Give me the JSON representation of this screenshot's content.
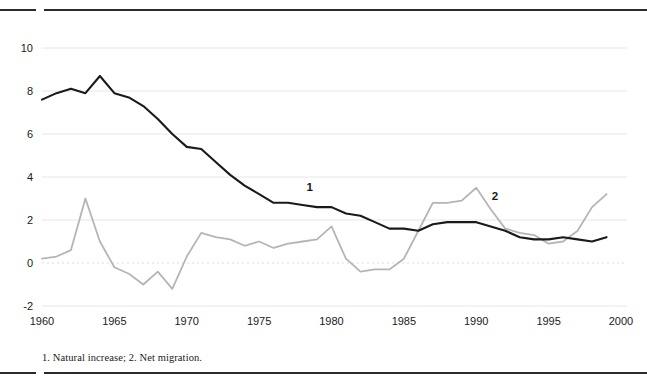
{
  "footnote": "1. Natural increase; 2. Net migration.",
  "colors": {
    "series1": "#1a1a1a",
    "series2": "#b5b5b5",
    "grid": "#e6e6e6",
    "zero_line": "#dcdcdc",
    "rule": "#2b2b2b",
    "text": "#1a1a1a",
    "background": "#ffffff"
  },
  "chart_data": {
    "type": "line",
    "title": "",
    "subtitle": "",
    "xlabel": "",
    "ylabel": "",
    "xlim": [
      1960,
      2000
    ],
    "ylim": [
      -2,
      10
    ],
    "grid": true,
    "gridlines_y": [
      -2,
      0,
      2,
      4,
      6,
      8,
      10
    ],
    "xticks": [
      "1960",
      "1965",
      "1970",
      "1975",
      "1980",
      "1985",
      "1990",
      "1995",
      "2000"
    ],
    "xtick_values": [
      1960,
      1965,
      1970,
      1975,
      1980,
      1985,
      1990,
      1995,
      2000
    ],
    "yticks": [
      "-2",
      "0",
      "2",
      "4",
      "6",
      "8",
      "10"
    ],
    "ytick_values": [
      -2,
      0,
      2,
      4,
      6,
      8,
      10
    ],
    "legend_position": "inline-annotation",
    "annotations": [
      {
        "text": "1",
        "x": 1978.5,
        "y": 3.35,
        "series": "series1"
      },
      {
        "text": "2",
        "x": 1991.3,
        "y": 2.95,
        "series": "series2"
      }
    ],
    "x": [
      1960,
      1961,
      1962,
      1963,
      1964,
      1965,
      1966,
      1967,
      1968,
      1969,
      1970,
      1971,
      1972,
      1973,
      1974,
      1975,
      1976,
      1977,
      1978,
      1979,
      1980,
      1981,
      1982,
      1983,
      1984,
      1985,
      1986,
      1987,
      1988,
      1989,
      1990,
      1991,
      1992,
      1993,
      1994,
      1995,
      1996,
      1997,
      1998,
      1999
    ],
    "series": [
      {
        "name": "1",
        "label": "Natural increase",
        "color": "#1a1a1a",
        "values": [
          7.6,
          7.9,
          8.1,
          7.9,
          8.7,
          7.9,
          7.7,
          7.3,
          6.7,
          6.0,
          5.4,
          5.3,
          4.7,
          4.1,
          3.6,
          3.2,
          2.8,
          2.8,
          2.7,
          2.6,
          2.6,
          2.3,
          2.2,
          1.9,
          1.6,
          1.6,
          1.5,
          1.8,
          1.9,
          1.9,
          1.9,
          1.7,
          1.5,
          1.2,
          1.1,
          1.1,
          1.2,
          1.1,
          1.0,
          1.2
        ]
      },
      {
        "name": "2",
        "label": "Net migration",
        "color": "#b5b5b5",
        "values": [
          0.2,
          0.3,
          0.6,
          3.0,
          1.0,
          -0.2,
          -0.5,
          -1.0,
          -0.4,
          -1.2,
          0.3,
          1.4,
          1.2,
          1.1,
          0.8,
          1.0,
          0.7,
          0.9,
          1.0,
          1.1,
          1.7,
          0.2,
          -0.4,
          -0.3,
          -0.3,
          0.2,
          1.5,
          2.8,
          2.8,
          2.9,
          3.5,
          2.5,
          1.6,
          1.4,
          1.3,
          0.9,
          1.0,
          1.5,
          2.6,
          3.2
        ]
      }
    ]
  }
}
